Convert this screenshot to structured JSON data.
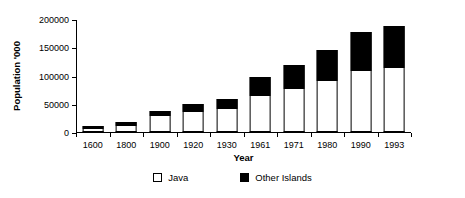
{
  "chart_data": {
    "type": "bar",
    "stacked": true,
    "title": "",
    "xlabel": "Year",
    "ylabel": "Population '000",
    "ylim": [
      0,
      200000
    ],
    "yticks": [
      0,
      50000,
      100000,
      150000,
      200000
    ],
    "ytick_labels": [
      "0",
      "50000",
      "100000",
      "150000",
      "200000"
    ],
    "grid": false,
    "legend_position": "bottom",
    "categories": [
      "1600",
      "1800",
      "1900",
      "1920",
      "1930",
      "1961",
      "1971",
      "1980",
      "1990",
      "1993"
    ],
    "series": [
      {
        "name": "Java",
        "color": "#ffffff",
        "values": [
          5000,
          10000,
          28000,
          35000,
          41000,
          63000,
          76000,
          91000,
          108000,
          114000
        ]
      },
      {
        "name": "Other Islands",
        "color": "#000000",
        "values": [
          5000,
          7000,
          10000,
          14000,
          18000,
          34000,
          42000,
          55000,
          69000,
          74000
        ]
      }
    ],
    "totals": [
      10000,
      17000,
      38000,
      49000,
      59000,
      97000,
      118000,
      146000,
      177000,
      188000
    ]
  },
  "legend": {
    "items": [
      {
        "label": "Java",
        "swatch": "hollow-square-icon"
      },
      {
        "label": "Other Islands",
        "swatch": "filled-square-icon"
      }
    ]
  }
}
